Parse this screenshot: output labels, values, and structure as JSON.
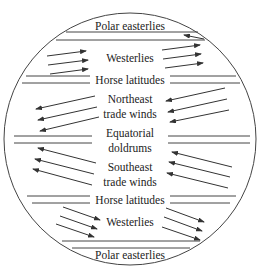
{
  "diagram": {
    "type": "global wind belts",
    "bands": [
      {
        "label": "Polar easterlies",
        "position": "top"
      },
      {
        "label": "Westerlies",
        "position": "north"
      },
      {
        "label": "Horse latitudes",
        "position": "north"
      },
      {
        "label_lines": [
          "Northeast",
          "trade winds"
        ],
        "position": "north-tropics"
      },
      {
        "label_lines": [
          "Equatorial",
          "doldrums"
        ],
        "position": "equator"
      },
      {
        "label_lines": [
          "Southeast",
          "trade winds"
        ],
        "position": "south-tropics"
      },
      {
        "label": "Horse latitudes",
        "position": "south"
      },
      {
        "label": "Westerlies",
        "position": "south"
      },
      {
        "label": "Polar easterlies",
        "position": "bottom"
      }
    ],
    "colors": {
      "line": "#333333",
      "text": "#222222",
      "background": "#ffffff"
    }
  }
}
